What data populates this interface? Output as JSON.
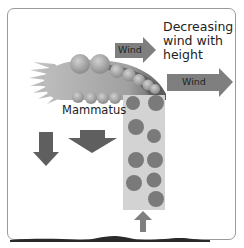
{
  "diagram": {
    "annotation": "Decreasing wind with height",
    "labels": {
      "wind_upper": "Wind",
      "wind_lower": "Wind",
      "mammatus": "Mammatus"
    },
    "elements": [
      {
        "name": "anvil-cloud",
        "description": "elongated gray cloud with spiky left edge and rounded puffs"
      },
      {
        "name": "precipitation-column",
        "description": "light gray rectangle with darker gray circles (precipitation particles)"
      },
      {
        "name": "wind-arrow-upper",
        "direction": "right",
        "label": "Wind",
        "size": "small"
      },
      {
        "name": "wind-arrow-lower",
        "direction": "right",
        "label": "Wind",
        "size": "large"
      },
      {
        "name": "downdraft-arrow-narrow",
        "direction": "down"
      },
      {
        "name": "downdraft-arrow-wide",
        "direction": "down"
      },
      {
        "name": "updraft-arrow",
        "direction": "up"
      },
      {
        "name": "ground",
        "description": "dark wavy terrain line"
      }
    ],
    "colors": {
      "frame_border": "#9a9a9a",
      "cloud": "#8a8a8a",
      "cloud_light": "#b5b5b5",
      "arrow_fill": "#7f7f7f",
      "arrow_dark": "#5c5c5c",
      "column_fill": "#d3d3d3",
      "particle": "#7a7a7a",
      "ground": "#2a2a2a"
    }
  }
}
